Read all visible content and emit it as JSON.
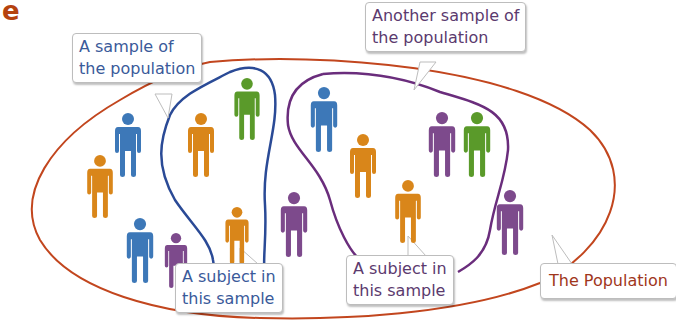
{
  "figure_label": "e",
  "colors": {
    "population_outline": "#c2461e",
    "sample1_outline": "#2a4a96",
    "sample2_outline": "#6a2d7c",
    "blue_person": "#3d78b8",
    "orange_person": "#d9861a",
    "green_person": "#5a9a2a",
    "purple_person": "#7d4a8c",
    "label_e": "#b5420e"
  },
  "callouts": {
    "sample1": {
      "line1": "A sample of",
      "line2": "the population"
    },
    "sample2": {
      "line1": "Another sample of",
      "line2": "the population"
    },
    "subject1": {
      "line1": "A subject in",
      "line2": "this sample"
    },
    "subject2": {
      "line1": "A subject in",
      "line2": "this sample"
    },
    "population": {
      "line1": "The Population"
    }
  },
  "people": [
    {
      "color": "blue",
      "x": 128,
      "y": 113,
      "h": 64
    },
    {
      "color": "orange",
      "x": 100,
      "y": 155,
      "h": 63
    },
    {
      "color": "blue",
      "x": 140,
      "y": 218,
      "h": 65
    },
    {
      "color": "purple",
      "x": 176,
      "y": 233,
      "h": 55
    },
    {
      "color": "orange",
      "x": 201,
      "y": 113,
      "h": 64
    },
    {
      "color": "green",
      "x": 247,
      "y": 78,
      "h": 62
    },
    {
      "color": "orange",
      "x": 237,
      "y": 207,
      "h": 57
    },
    {
      "color": "purple",
      "x": 294,
      "y": 192,
      "h": 65
    },
    {
      "color": "blue",
      "x": 324,
      "y": 87,
      "h": 65
    },
    {
      "color": "orange",
      "x": 363,
      "y": 134,
      "h": 64
    },
    {
      "color": "purple",
      "x": 442,
      "y": 112,
      "h": 65
    },
    {
      "color": "green",
      "x": 477,
      "y": 112,
      "h": 65
    },
    {
      "color": "orange",
      "x": 408,
      "y": 180,
      "h": 63
    },
    {
      "color": "purple",
      "x": 510,
      "y": 190,
      "h": 65
    }
  ]
}
